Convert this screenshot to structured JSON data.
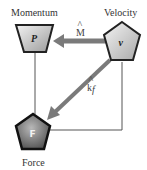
{
  "diagram": {
    "nodes": [
      {
        "id": "P",
        "symbol": "P",
        "label": "Momentum",
        "shape": "inverted-trapezoid",
        "fill": "#c8c8c8"
      },
      {
        "id": "v",
        "symbol": "v",
        "label": "Velocity",
        "shape": "pentagon",
        "fill": "#d0d0d0"
      },
      {
        "id": "F",
        "symbol": "F",
        "label": "Force",
        "shape": "pentagon",
        "fill": "#6a6a6a"
      }
    ],
    "edges": [
      {
        "from": "v",
        "to": "P",
        "label": "M",
        "label_hat": "^",
        "style": "thick-arrow",
        "color": "#777777"
      },
      {
        "from": "v",
        "to": "F",
        "label": "k",
        "label_hat": "^",
        "label_sub": "f",
        "style": "thick-arrow",
        "color": "#777777"
      },
      {
        "from": "P",
        "to": "F",
        "style": "thin-line",
        "color": "#555555"
      },
      {
        "from": "v",
        "to": "F",
        "style": "thin-elbow-line",
        "color": "#555555"
      }
    ]
  }
}
